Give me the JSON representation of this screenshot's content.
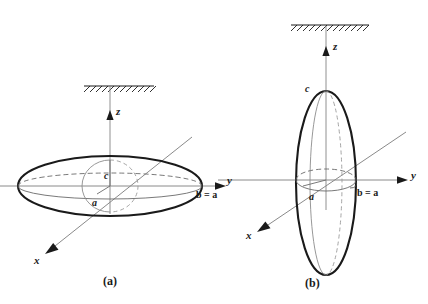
{
  "figure": {
    "background": "#ffffff",
    "ink_color": "#1a1a1a",
    "thin_color": "#808080",
    "dash_color": "#6e6e6e",
    "width": 428,
    "height": 304,
    "panels": [
      {
        "id": "a",
        "caption": "(a)",
        "shape": "oblate",
        "description": "Oblate ellipsoid (disc-like) with symmetry axis c along z",
        "center": {
          "x": 110,
          "y": 186
        },
        "ellipsoid": {
          "rx": 92,
          "ry": 30,
          "equator_ry": 13,
          "polar_ry": 26
        },
        "axes": {
          "z": {
            "label": "z",
            "direction": "up",
            "x": 110,
            "from_y": 186,
            "to_y": 88,
            "arrow_y": 116
          },
          "y": {
            "label": "y",
            "direction": "right",
            "y": 186,
            "from_x": 0,
            "to_x": 226
          },
          "x": {
            "label": "x",
            "direction": "down-left",
            "from_x": 190,
            "from_y": 139,
            "to_x": 46,
            "to_y": 253
          }
        },
        "hatch": {
          "x1": 84,
          "x2": 154,
          "y": 86,
          "ticks": 11
        },
        "labels": {
          "z": {
            "text": "z",
            "x": 116,
            "y": 112
          },
          "y": {
            "text": "y",
            "x": 228,
            "y": 181
          },
          "x": {
            "text": "x",
            "x": 35,
            "y": 260
          },
          "c": {
            "text": "c",
            "x": 105,
            "y": 177
          },
          "a": {
            "text": "a",
            "x": 93,
            "y": 204
          },
          "b_eq_a": {
            "text": "b = a",
            "x": 197,
            "y": 195
          }
        }
      },
      {
        "id": "b",
        "caption": "(b)",
        "shape": "prolate",
        "description": "Prolate ellipsoid (cigar-like) with long axis c along z",
        "center": {
          "x": 326,
          "y": 183
        },
        "ellipsoid": {
          "rx": 30,
          "ry": 92,
          "equator_rx": 30,
          "equator_ry": 11
        },
        "axes": {
          "z": {
            "label": "z",
            "direction": "up",
            "x": 326,
            "from_y": 183,
            "to_y": 26,
            "arrow_y": 52
          },
          "y": {
            "label": "y",
            "direction": "right",
            "y": 180,
            "from_x": 218,
            "to_x": 408
          },
          "x": {
            "label": "x",
            "direction": "down-left",
            "from_x": 404,
            "from_y": 134,
            "to_x": 258,
            "to_y": 232
          }
        },
        "hatch": {
          "x1": 292,
          "x2": 368,
          "y": 25,
          "ticks": 12
        },
        "labels": {
          "z": {
            "text": "z",
            "x": 333,
            "y": 47
          },
          "y": {
            "text": "y",
            "x": 412,
            "y": 176
          },
          "x": {
            "text": "x",
            "x": 248,
            "y": 235
          },
          "c": {
            "text": "c",
            "x": 306,
            "y": 90
          },
          "a": {
            "text": "a",
            "x": 310,
            "y": 198
          },
          "b_eq_a": {
            "text": "b = a",
            "x": 358,
            "y": 193
          }
        }
      }
    ],
    "captions": [
      {
        "text": "(a)",
        "x": 104,
        "y": 277
      },
      {
        "text": "(b)",
        "x": 306,
        "y": 279
      }
    ]
  }
}
